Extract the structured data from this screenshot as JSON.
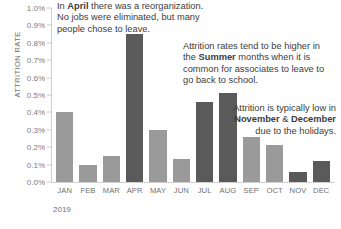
{
  "chart_data": {
    "type": "bar",
    "title": "",
    "xlabel": "2019",
    "ylabel": "ATTRITION RATE",
    "categories": [
      "JAN",
      "FEB",
      "MAR",
      "APR",
      "MAY",
      "JUN",
      "JUL",
      "AUG",
      "SEP",
      "OCT",
      "NOV",
      "DEC"
    ],
    "values": [
      0.4,
      0.1,
      0.15,
      0.85,
      0.3,
      0.13,
      0.46,
      0.51,
      0.26,
      0.21,
      0.06,
      0.12
    ],
    "value_unit": "%",
    "ylim": [
      0.0,
      1.0
    ],
    "ytick_labels": [
      "0.0%",
      "0.1%",
      "0.2%",
      "0.3%",
      "0.4%",
      "0.5%",
      "0.6%",
      "0.7%",
      "0.8%",
      "0.9%",
      "1.0%"
    ],
    "ytick_values": [
      0.0,
      0.1,
      0.2,
      0.3,
      0.4,
      0.5,
      0.6,
      0.7,
      0.8,
      0.9,
      1.0
    ],
    "grid": false,
    "legend": null,
    "bar_colors": [
      "light",
      "light",
      "light",
      "dark",
      "light",
      "light",
      "dark",
      "dark",
      "light",
      "light",
      "dark",
      "dark"
    ],
    "colors": {
      "bar_light": "#9a9a9a",
      "bar_dark": "#5a5a5a",
      "axis": "#cfcfcf",
      "tick_text": "#7a7a7a",
      "annotation_text": "#3c3c3c"
    },
    "annotations": [
      {
        "id": "april",
        "segments": [
          {
            "text": "In ",
            "bold": false
          },
          {
            "text": "April",
            "bold": true
          },
          {
            "text": " there was a reorganization. No jobs were eliminated, but many people chose to leave.",
            "bold": false
          }
        ]
      },
      {
        "id": "summer",
        "segments": [
          {
            "text": "Attrition rates tend to be higher in the ",
            "bold": false
          },
          {
            "text": "Summer",
            "bold": true
          },
          {
            "text": " months when it is common for associates to leave to go back to school.",
            "bold": false
          }
        ]
      },
      {
        "id": "holidays",
        "segments": [
          {
            "text": "Attrition is typically low in ",
            "bold": false
          },
          {
            "text": "November",
            "bold": true
          },
          {
            "text": " & ",
            "bold": false
          },
          {
            "text": "December",
            "bold": true
          },
          {
            "text": " due to the holidays.",
            "bold": false
          }
        ]
      }
    ]
  }
}
